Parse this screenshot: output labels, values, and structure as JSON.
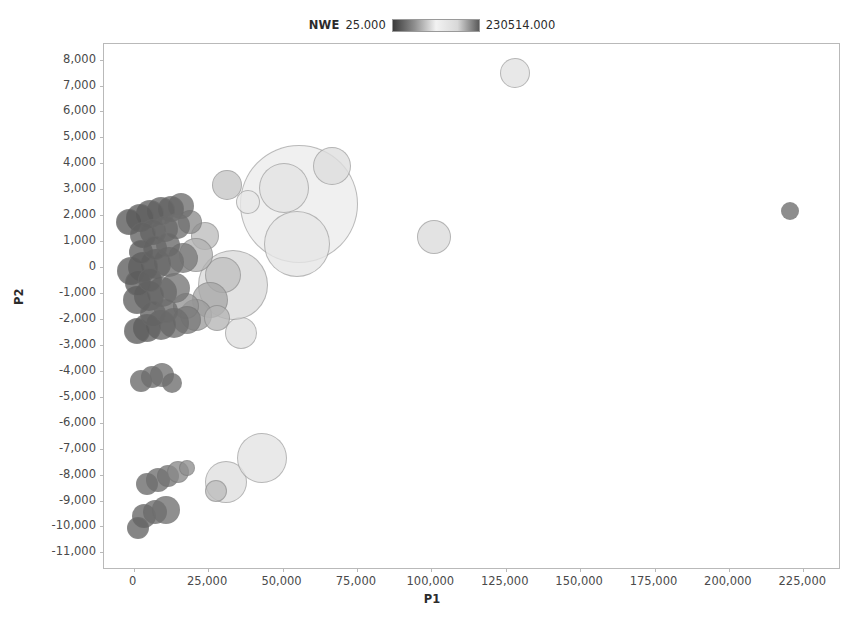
{
  "legend": {
    "title": "NWE",
    "min_label": "25.000",
    "max_label": "230514.000",
    "gradient_stops": [
      "#3b3b3b",
      "#8f8f8f",
      "#f2f2f2",
      "#d8d8d8",
      "#5a5a5a"
    ]
  },
  "axes": {
    "x_title": "P1",
    "y_title": "P2",
    "x_ticks": [
      "0",
      "25,000",
      "50,000",
      "75,000",
      "100,000",
      "125,000",
      "150,000",
      "175,000",
      "200,000",
      "225,000"
    ],
    "y_ticks": [
      "8,000",
      "7,000",
      "6,000",
      "5,000",
      "4,000",
      "3,000",
      "2,000",
      "1,000",
      "0",
      "-1,000",
      "-2,000",
      "-3,000",
      "-4,000",
      "-5,000",
      "-6,000",
      "-7,000",
      "-8,000",
      "-9,000",
      "-10,000",
      "-11,000"
    ]
  },
  "caption": "",
  "chart_data": {
    "type": "scatter",
    "title": "",
    "xlabel": "P1",
    "ylabel": "P2",
    "xlim": [
      -10000,
      237000
    ],
    "ylim": [
      -11600,
      8600
    ],
    "xticks": [
      0,
      25000,
      50000,
      75000,
      100000,
      125000,
      150000,
      175000,
      200000,
      225000
    ],
    "yticks": [
      8000,
      7000,
      6000,
      5000,
      4000,
      3000,
      2000,
      1000,
      0,
      -1000,
      -2000,
      -3000,
      -4000,
      -5000,
      -6000,
      -7000,
      -8000,
      -9000,
      -10000,
      -11000
    ],
    "grid": false,
    "legend_position": "top-center",
    "size_encoding": "bubble area",
    "color_encoding": "NWE (grayscale, dark = low, light = high)",
    "color_range": [
      25.0,
      230514.0
    ],
    "points": [
      {
        "x": 128000,
        "y": 7500,
        "r": 15,
        "c": "#e2e2e2"
      },
      {
        "x": 220500,
        "y": 2150,
        "r": 9,
        "c": "#6e6e6e"
      },
      {
        "x": 101000,
        "y": 1150,
        "r": 17,
        "c": "#dcdcdc"
      },
      {
        "x": 55500,
        "y": 2450,
        "r": 59,
        "c": "#ececec"
      },
      {
        "x": 66500,
        "y": 3900,
        "r": 19,
        "c": "#dedede"
      },
      {
        "x": 50500,
        "y": 3050,
        "r": 25,
        "c": "#e4e4e4"
      },
      {
        "x": 55000,
        "y": 900,
        "r": 33,
        "c": "#e6e6e6"
      },
      {
        "x": 38500,
        "y": 2500,
        "r": 12,
        "c": "#e8e8e8"
      },
      {
        "x": 31500,
        "y": 3150,
        "r": 15,
        "c": "#c6c6c6"
      },
      {
        "x": 36000,
        "y": -2550,
        "r": 16,
        "c": "#e0e0e0"
      },
      {
        "x": 33500,
        "y": -700,
        "r": 35,
        "c": "#dadada"
      },
      {
        "x": 30000,
        "y": -300,
        "r": 18,
        "c": "#c0c0c0"
      },
      {
        "x": 24000,
        "y": 1200,
        "r": 14,
        "c": "#bdbdbd"
      },
      {
        "x": 21000,
        "y": 450,
        "r": 17,
        "c": "#b2b2b2"
      },
      {
        "x": 25500,
        "y": -1250,
        "r": 18,
        "c": "#a8a8a8"
      },
      {
        "x": 21000,
        "y": -1850,
        "r": 16,
        "c": "#9d9d9d"
      },
      {
        "x": 28000,
        "y": -1950,
        "r": 13,
        "c": "#b5b5b5"
      },
      {
        "x": 17500,
        "y": -1500,
        "r": 13,
        "c": "#949494"
      },
      {
        "x": 19000,
        "y": 1750,
        "r": 12,
        "c": "#8d8d8d"
      },
      {
        "x": 16000,
        "y": 2350,
        "r": 13,
        "c": "#6e6e6e"
      },
      {
        "x": 12500,
        "y": 2250,
        "r": 13,
        "c": "#666666"
      },
      {
        "x": 9000,
        "y": 2150,
        "r": 14,
        "c": "#636363"
      },
      {
        "x": 5500,
        "y": 2050,
        "r": 14,
        "c": "#5f5f5f"
      },
      {
        "x": 2000,
        "y": 1900,
        "r": 14,
        "c": "#5c5c5c"
      },
      {
        "x": -1500,
        "y": 1750,
        "r": 13,
        "c": "#595959"
      },
      {
        "x": 14500,
        "y": 1600,
        "r": 13,
        "c": "#707070"
      },
      {
        "x": 10500,
        "y": 1450,
        "r": 13,
        "c": "#6a6a6a"
      },
      {
        "x": 6500,
        "y": 1350,
        "r": 13,
        "c": "#666666"
      },
      {
        "x": 3000,
        "y": 1250,
        "r": 13,
        "c": "#626262"
      },
      {
        "x": 16500,
        "y": 350,
        "r": 15,
        "c": "#7b7b7b"
      },
      {
        "x": 12000,
        "y": 200,
        "r": 15,
        "c": "#6f6f6f"
      },
      {
        "x": 7500,
        "y": 100,
        "r": 15,
        "c": "#676767"
      },
      {
        "x": 3000,
        "y": 0,
        "r": 15,
        "c": "#616161"
      },
      {
        "x": -1000,
        "y": -150,
        "r": 14,
        "c": "#5d5d5d"
      },
      {
        "x": 14000,
        "y": -800,
        "r": 15,
        "c": "#757575"
      },
      {
        "x": 9500,
        "y": -950,
        "r": 15,
        "c": "#6b6b6b"
      },
      {
        "x": 5000,
        "y": -1100,
        "r": 15,
        "c": "#646464"
      },
      {
        "x": 1000,
        "y": -1250,
        "r": 14,
        "c": "#5f5f5f"
      },
      {
        "x": 18000,
        "y": -2050,
        "r": 14,
        "c": "#7a7a7a"
      },
      {
        "x": 13500,
        "y": -2150,
        "r": 15,
        "c": "#6e6e6e"
      },
      {
        "x": 9000,
        "y": -2250,
        "r": 15,
        "c": "#666666"
      },
      {
        "x": 4500,
        "y": -2350,
        "r": 14,
        "c": "#606060"
      },
      {
        "x": 1000,
        "y": -2450,
        "r": 13,
        "c": "#5c5c5c"
      },
      {
        "x": 6500,
        "y": -1800,
        "r": 13,
        "c": "#646464"
      },
      {
        "x": 11000,
        "y": -1700,
        "r": 12,
        "c": "#6b6b6b"
      },
      {
        "x": 2500,
        "y": 600,
        "r": 12,
        "c": "#5e5e5e"
      },
      {
        "x": 7000,
        "y": 750,
        "r": 12,
        "c": "#636363"
      },
      {
        "x": 11500,
        "y": 850,
        "r": 12,
        "c": "#696969"
      },
      {
        "x": 1500,
        "y": -600,
        "r": 13,
        "c": "#5d5d5d"
      },
      {
        "x": 5500,
        "y": -500,
        "r": 12,
        "c": "#626262"
      },
      {
        "x": 2500,
        "y": -4400,
        "r": 11,
        "c": "#6a6a6a"
      },
      {
        "x": 6000,
        "y": -4250,
        "r": 11,
        "c": "#6d6d6d"
      },
      {
        "x": 9500,
        "y": -4150,
        "r": 12,
        "c": "#717171"
      },
      {
        "x": 13000,
        "y": -4450,
        "r": 10,
        "c": "#6e6e6e"
      },
      {
        "x": 4500,
        "y": -8350,
        "r": 11,
        "c": "#6a6a6a"
      },
      {
        "x": 8000,
        "y": -8200,
        "r": 12,
        "c": "#6f6f6f"
      },
      {
        "x": 11500,
        "y": -8050,
        "r": 11,
        "c": "#747474"
      },
      {
        "x": 15000,
        "y": -7900,
        "r": 11,
        "c": "#8a8a8a"
      },
      {
        "x": 18000,
        "y": -7750,
        "r": 8,
        "c": "#8f8f8f"
      },
      {
        "x": 3500,
        "y": -9600,
        "r": 12,
        "c": "#666666"
      },
      {
        "x": 7000,
        "y": -9450,
        "r": 12,
        "c": "#6b6b6b"
      },
      {
        "x": 11000,
        "y": -9350,
        "r": 14,
        "c": "#707070"
      },
      {
        "x": 1500,
        "y": -10050,
        "r": 11,
        "c": "#636363"
      },
      {
        "x": 31000,
        "y": -8300,
        "r": 21,
        "c": "#e0e0e0"
      },
      {
        "x": 27500,
        "y": -8650,
        "r": 11,
        "c": "#bcbcbc"
      },
      {
        "x": 43000,
        "y": -7350,
        "r": 25,
        "c": "#e4e4e4"
      }
    ]
  }
}
